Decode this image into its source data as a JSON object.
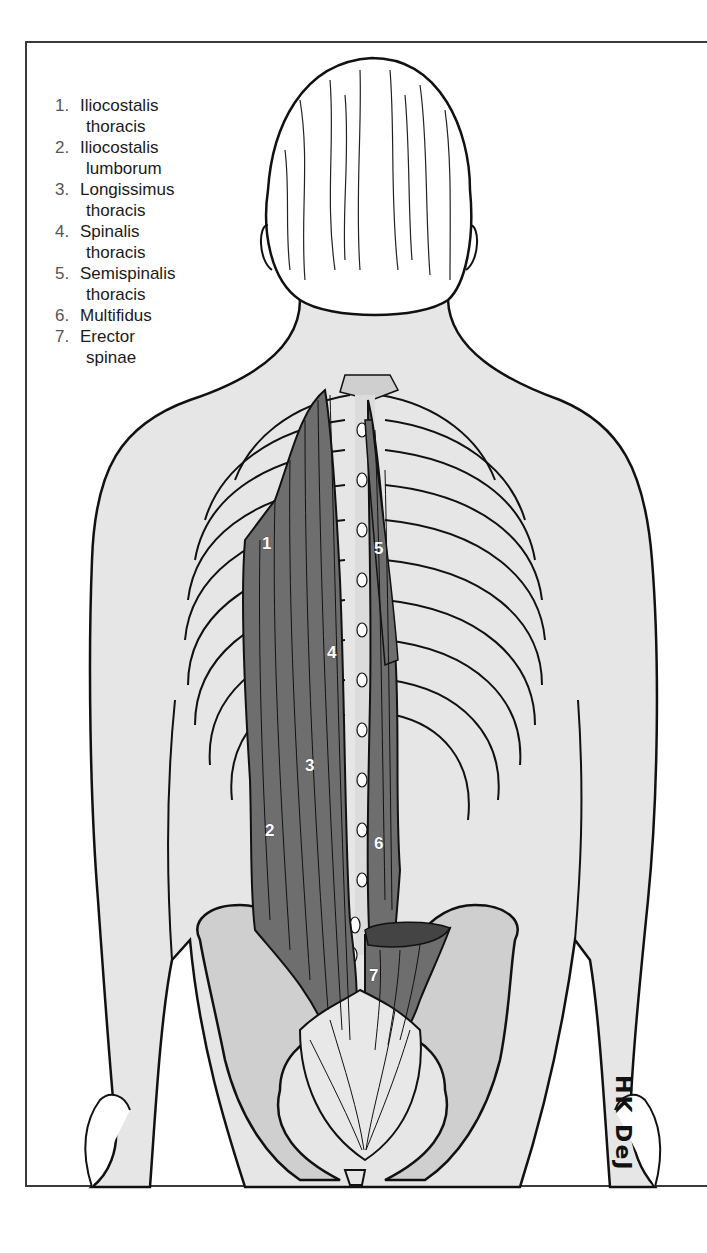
{
  "figure": {
    "legend": [
      {
        "num": "1.",
        "line1": "Iliocostalis",
        "line2": "thoracis"
      },
      {
        "num": "2.",
        "line1": "Iliocostalis",
        "line2": "lumborum"
      },
      {
        "num": "3.",
        "line1": "Longissimus",
        "line2": "thoracis"
      },
      {
        "num": "4.",
        "line1": "Spinalis",
        "line2": "thoracis"
      },
      {
        "num": "5.",
        "line1": "Semispinalis",
        "line2": "thoracis"
      },
      {
        "num": "6.",
        "line1": "Multifidus",
        "line2": ""
      },
      {
        "num": "7.",
        "line1": "Erector",
        "line2": "spinae"
      }
    ],
    "labels": [
      {
        "id": "1",
        "x": 268,
        "y": 543
      },
      {
        "id": "2",
        "x": 271,
        "y": 830
      },
      {
        "id": "3",
        "x": 311,
        "y": 765
      },
      {
        "id": "4",
        "x": 333,
        "y": 652
      },
      {
        "id": "5",
        "x": 380,
        "y": 548
      },
      {
        "id": "6",
        "x": 380,
        "y": 843
      },
      {
        "id": "7",
        "x": 375,
        "y": 975
      }
    ],
    "signature": "HK DeJ",
    "colors": {
      "skin": "#e6e6e6",
      "bone": "#cfcfcf",
      "muscle": "#6e6e6e",
      "outline": "#111111",
      "tendon": "#e8e8e8"
    }
  }
}
